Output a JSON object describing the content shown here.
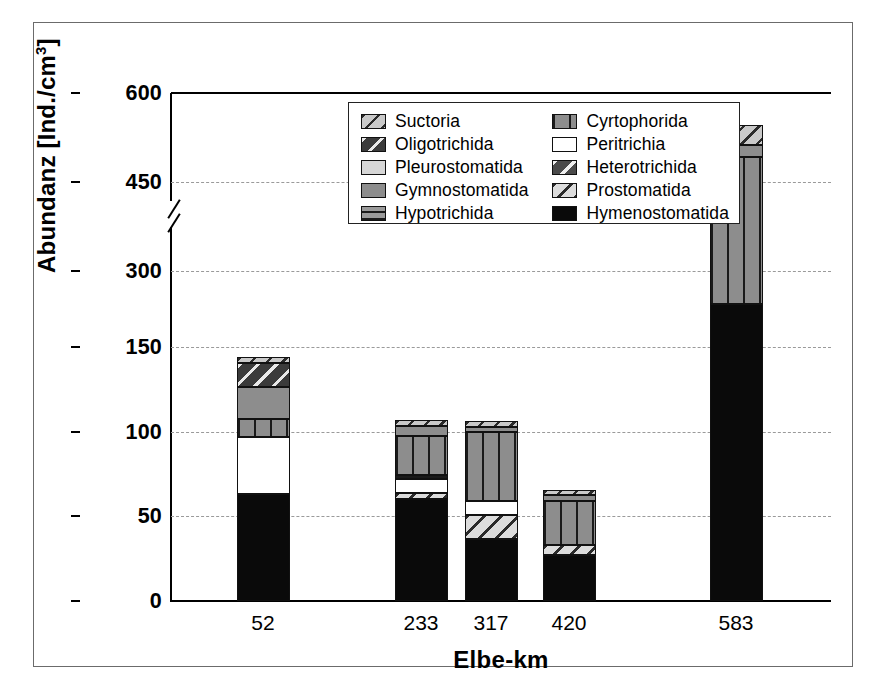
{
  "chart_data": {
    "type": "bar",
    "title": "",
    "subtitle": "",
    "xlabel": "Elbe-km",
    "ylabel": "Abundanz [Ind./cm³]",
    "ylabel_main": "Abundanz [Ind./cm",
    "ylabel_sup": "3",
    "ylabel_tail": "]",
    "stacked": true,
    "grid": true,
    "legend_position": "inside-top-center",
    "axis_break": {
      "present": true,
      "below": 175,
      "above": 300
    },
    "ylim": [
      0,
      600
    ],
    "yticks": [
      "0",
      "50",
      "100",
      "150",
      "300",
      "450",
      "600"
    ],
    "ytick_values": [
      0,
      50,
      100,
      150,
      300,
      450,
      600
    ],
    "categories": [
      "52",
      "233",
      "317",
      "420",
      "583"
    ],
    "series": [
      {
        "name": "Hymenostomatida",
        "values": [
          63,
          60.5,
          36.5,
          27,
          245
        ]
      },
      {
        "name": "Prostomatida",
        "values": [
          0,
          3.5,
          14.5,
          6,
          0
        ]
      },
      {
        "name": "Peritrichia",
        "values": [
          34,
          8,
          8,
          0,
          0
        ]
      },
      {
        "name": "Heterotrichida",
        "values": [
          0,
          0,
          0,
          0,
          0
        ]
      },
      {
        "name": "Hypotrichida",
        "values": [
          0,
          2.5,
          0,
          0,
          0
        ]
      },
      {
        "name": "Cyrtophorida",
        "values": [
          10.5,
          23,
          41,
          26,
          247
        ]
      },
      {
        "name": "Gymnostomatida",
        "values": [
          19,
          6,
          3,
          3.5,
          20
        ]
      },
      {
        "name": "Pleurostomatida",
        "values": [
          0,
          0,
          0,
          0,
          0
        ]
      },
      {
        "name": "Oligotrichida",
        "values": [
          14,
          0,
          0,
          0,
          0
        ]
      },
      {
        "name": "Suctoria",
        "values": [
          3.5,
          3.5,
          3.5,
          3,
          34
        ]
      }
    ],
    "totals": [
      144,
      107,
      106.5,
      65.5,
      546
    ]
  },
  "legend": {
    "items": [
      {
        "label": "Suctoria",
        "pattern": "light-gray-diagonal-hatch",
        "color": "#c9c9c9"
      },
      {
        "label": "Cyrtophorida",
        "pattern": "gray-vertical-lines",
        "color": "#8d8d8d"
      },
      {
        "label": "Oligotrichida",
        "pattern": "dark-diagonal-hatch",
        "color": "#3b3b3b"
      },
      {
        "label": "Peritrichia",
        "pattern": "solid-white",
        "color": "#ffffff"
      },
      {
        "label": "Pleurostomatida",
        "pattern": "solid-light-gray",
        "color": "#d6d6d6"
      },
      {
        "label": "Heterotrichida",
        "pattern": "dark-gray-diagonal-hatch",
        "color": "#4a4a4a"
      },
      {
        "label": "Gymnostomatida",
        "pattern": "solid-medium-gray",
        "color": "#8d8d8d"
      },
      {
        "label": "Prostomatida",
        "pattern": "pale-diagonal-hatch",
        "color": "#dcdcdc"
      },
      {
        "label": "Hypotrichida",
        "pattern": "gray-horizontal-lines",
        "color": "#9a9a9a"
      },
      {
        "label": "Hymenostomatida",
        "pattern": "solid-black",
        "color": "#0a0a0a"
      }
    ]
  }
}
